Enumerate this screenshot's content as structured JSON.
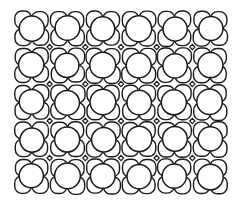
{
  "image": {
    "description": "Hand-drawn line illustration of a tiled pattern: a grid of circles, each surrounded by four rounded petal-shaped cells, with small diamond-shaped gaps at cell junctions",
    "style": "black ink line drawing on white",
    "stroke_color": "#1a1a1a",
    "background_color": "#ffffff"
  },
  "grid": {
    "columns": 6,
    "rows": 5,
    "left": 14,
    "top": 10,
    "right": 228,
    "bottom": 195,
    "circle_radius": 12.5
  }
}
